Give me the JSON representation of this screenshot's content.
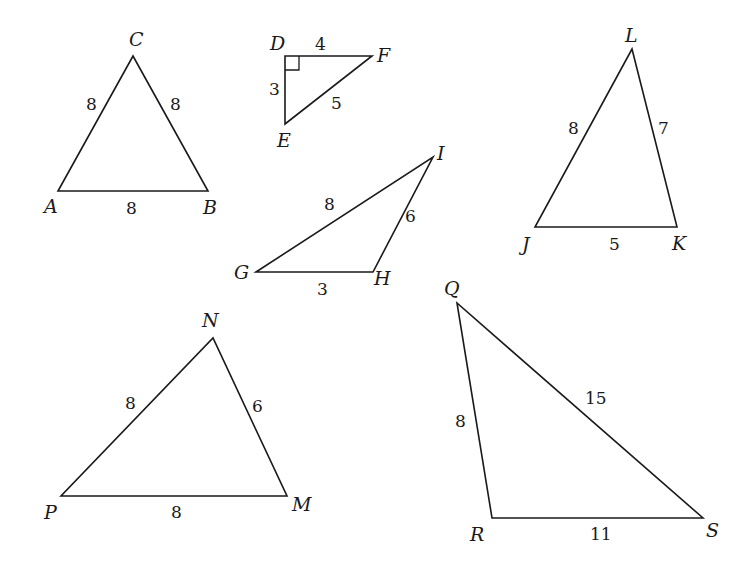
{
  "figure": {
    "stroke_color": "#1a1a1a",
    "background": "#ffffff"
  },
  "triangles": [
    {
      "id": "ABC",
      "vertices": {
        "A": "A",
        "B": "B",
        "C": "C"
      },
      "sides": {
        "CA": "8",
        "CB": "8",
        "AB": "8"
      }
    },
    {
      "id": "DEF",
      "vertices": {
        "D": "D",
        "E": "E",
        "F": "F"
      },
      "sides": {
        "DF": "4",
        "DE": "3",
        "EF": "5"
      },
      "right_angle_at": "D"
    },
    {
      "id": "GHI",
      "vertices": {
        "G": "G",
        "H": "H",
        "I": "I"
      },
      "sides": {
        "GI": "8",
        "HI": "6",
        "GH": "3"
      }
    },
    {
      "id": "JKL",
      "vertices": {
        "J": "J",
        "K": "K",
        "L": "L"
      },
      "sides": {
        "JL": "8",
        "KL": "7",
        "JK": "5"
      }
    },
    {
      "id": "MNP",
      "vertices": {
        "M": "M",
        "N": "N",
        "P": "P"
      },
      "sides": {
        "PN": "8",
        "NM": "6",
        "PM": "8"
      }
    },
    {
      "id": "QRS",
      "vertices": {
        "Q": "Q",
        "R": "R",
        "S": "S"
      },
      "sides": {
        "QR": "8",
        "QS": "15",
        "RS": "11"
      }
    }
  ]
}
